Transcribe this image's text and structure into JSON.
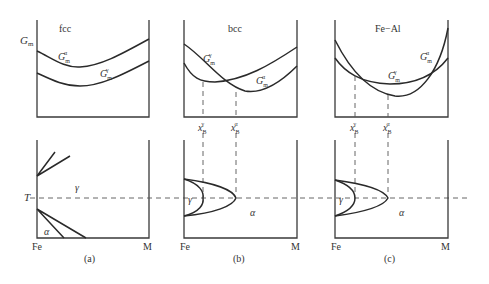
{
  "figure": {
    "panels": [
      {
        "id": "a",
        "title": "fcc",
        "caption": "(a)",
        "y_axis_label": "G",
        "y_axis_label_sub": "m",
        "curve_labels": [
          {
            "main": "G",
            "sub": "m",
            "sup": "α"
          },
          {
            "main": "G",
            "sub": "m",
            "sup": "γ"
          }
        ],
        "phase_labels": [
          "γ",
          "α"
        ],
        "temperature_label": "T",
        "x_left": "Fe",
        "x_right": "M"
      },
      {
        "id": "b",
        "title": "bcc",
        "caption": "(b)",
        "curve_labels": [
          {
            "main": "G",
            "sub": "m",
            "sup": "γ"
          },
          {
            "main": "G",
            "sub": "m",
            "sup": "α"
          }
        ],
        "x_markers": [
          {
            "main": "x",
            "sub": "B",
            "sup": "γ"
          },
          {
            "main": "x",
            "sub": "B",
            "sup": "α"
          }
        ],
        "phase_labels": [
          "γ",
          "α"
        ],
        "x_left": "Fe",
        "x_right": "M"
      },
      {
        "id": "c",
        "title": "Fe−Al",
        "caption": "(c)",
        "curve_labels": [
          {
            "main": "G",
            "sub": "m",
            "sup": "α"
          },
          {
            "main": "G",
            "sub": "m",
            "sup": "γ"
          }
        ],
        "x_markers": [
          {
            "main": "x",
            "sub": "B",
            "sup": "γ"
          },
          {
            "main": "x",
            "sub": "B",
            "sup": "α"
          }
        ],
        "phase_labels": [
          "γ",
          "α"
        ],
        "x_left": "Fe",
        "x_right": "M"
      }
    ]
  }
}
